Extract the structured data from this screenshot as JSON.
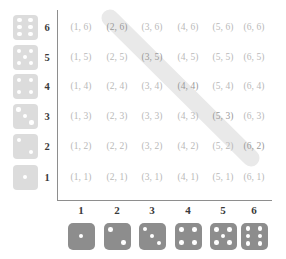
{
  "figure": {
    "type": "sample-space-grid",
    "highlight": {
      "name": "sum-eight-band",
      "color": "#e9e9e9",
      "cells": [
        "(2, 6)",
        "(3, 5)",
        "(4, 4)",
        "(5, 3)",
        "(6, 2)"
      ]
    },
    "colors": {
      "cell_text": "#b9b9b9",
      "cell_text_highlighted": "#9a9a9a",
      "axis_label": "#3a3a3a",
      "axis_line": "#8e8e8e",
      "die_light": "#dcdcdc",
      "die_dark": "#8d8d8d",
      "pip": "#ffffff",
      "background": "#ffffff"
    }
  },
  "axes": {
    "row_labels": [
      "6",
      "5",
      "4",
      "3",
      "2",
      "1"
    ],
    "col_labels": [
      "1",
      "2",
      "3",
      "4",
      "5",
      "6"
    ]
  },
  "dice": {
    "row_dice": [
      {
        "name": "die-face-6",
        "value": 6
      },
      {
        "name": "die-face-5",
        "value": 5
      },
      {
        "name": "die-face-4",
        "value": 4
      },
      {
        "name": "die-face-3",
        "value": 3
      },
      {
        "name": "die-face-2",
        "value": 2
      },
      {
        "name": "die-face-1",
        "value": 1
      }
    ],
    "col_dice": [
      {
        "name": "die-face-1",
        "value": 1
      },
      {
        "name": "die-face-2",
        "value": 2
      },
      {
        "name": "die-face-3",
        "value": 3
      },
      {
        "name": "die-face-4",
        "value": 4
      },
      {
        "name": "die-face-5",
        "value": 5
      },
      {
        "name": "die-face-6",
        "value": 6
      }
    ]
  },
  "grid": {
    "rows": [
      {
        "row_value": 6,
        "cells": [
          "(1, 6)",
          "(2, 6)",
          "(3, 6)",
          "(4, 6)",
          "(5, 6)",
          "(6, 6)"
        ]
      },
      {
        "row_value": 5,
        "cells": [
          "(1, 5)",
          "(2, 5)",
          "(3, 5)",
          "(4, 5)",
          "(5, 5)",
          "(6, 5)"
        ]
      },
      {
        "row_value": 4,
        "cells": [
          "(1, 4)",
          "(2, 4)",
          "(3, 4)",
          "(4, 4)",
          "(5, 4)",
          "(6, 4)"
        ]
      },
      {
        "row_value": 3,
        "cells": [
          "(1, 3)",
          "(2, 3)",
          "(3, 3)",
          "(4, 3)",
          "(5, 3)",
          "(6, 3)"
        ]
      },
      {
        "row_value": 2,
        "cells": [
          "(1, 2)",
          "(2, 2)",
          "(3, 2)",
          "(4, 2)",
          "(5, 2)",
          "(6, 2)"
        ]
      },
      {
        "row_value": 1,
        "cells": [
          "(1, 1)",
          "(2, 1)",
          "(3, 1)",
          "(4, 1)",
          "(5, 1)",
          "(6, 1)"
        ]
      }
    ]
  },
  "chart_data": {
    "type": "table",
    "title": "",
    "xlabel": "",
    "ylabel": "",
    "categories": [
      "1",
      "2",
      "3",
      "4",
      "5",
      "6"
    ],
    "row_categories": [
      "6",
      "5",
      "4",
      "3",
      "2",
      "1"
    ],
    "values": [
      [
        "(1, 6)",
        "(2, 6)",
        "(3, 6)",
        "(4, 6)",
        "(5, 6)",
        "(6, 6)"
      ],
      [
        "(1, 5)",
        "(2, 5)",
        "(3, 5)",
        "(4, 5)",
        "(5, 5)",
        "(6, 5)"
      ],
      [
        "(1, 4)",
        "(2, 4)",
        "(3, 4)",
        "(4, 4)",
        "(5, 4)",
        "(6, 4)"
      ],
      [
        "(1, 3)",
        "(2, 3)",
        "(3, 3)",
        "(4, 3)",
        "(5, 3)",
        "(6, 3)"
      ],
      [
        "(1, 2)",
        "(2, 2)",
        "(3, 2)",
        "(4, 2)",
        "(5, 2)",
        "(6, 2)"
      ],
      [
        "(1, 1)",
        "(2, 1)",
        "(3, 1)",
        "(4, 1)",
        "(5, 1)",
        "(6, 1)"
      ]
    ],
    "highlighted": [
      "(2, 6)",
      "(3, 5)",
      "(4, 4)",
      "(5, 3)",
      "(6, 2)"
    ],
    "grid": false,
    "legend": "none"
  }
}
